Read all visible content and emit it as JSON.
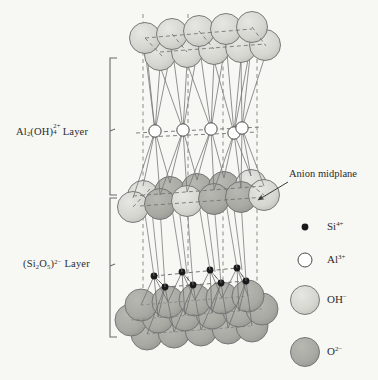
{
  "figure": {
    "name": "kaolinite-crystal-structure",
    "background_color": "#f7f7f4"
  },
  "labels": {
    "al_layer": {
      "formula_base": "Al",
      "sub1": "2",
      "mid": "(OH)",
      "sup_charge": "2+",
      "sub_count": "4",
      "suffix": " Layer"
    },
    "si_layer": {
      "open": "(Si",
      "sub1": "2",
      "o": "O",
      "sub2": "5",
      "close": ")",
      "sup_charge": "2−",
      "suffix": " Layer"
    },
    "anion_midplane": "Anion midplane"
  },
  "legend": {
    "items": [
      {
        "key": "si",
        "symbol": "Si",
        "charge": "4+",
        "marker": "filled-dot",
        "color": "#1a1a1a",
        "radius": 3.4
      },
      {
        "key": "al",
        "symbol": "Al",
        "charge": "3+",
        "marker": "open-circle",
        "color": "#ffffff",
        "radius": 7.0
      },
      {
        "key": "oh",
        "symbol": "OH",
        "charge": "−",
        "marker": "light-sphere",
        "color": "#d6d6d1",
        "radius": 14.5
      },
      {
        "key": "o",
        "symbol": "O",
        "charge": "2−",
        "marker": "dark-sphere",
        "color": "#a9a9a4",
        "radius": 14.5
      }
    ]
  },
  "colors": {
    "oh_fill": "#d6d6d1",
    "o_fill": "#a9a9a4",
    "al_fill": "#ffffff",
    "si_fill": "#1a1a1a",
    "outline": "#6e6e6e",
    "bond": "#767676",
    "dash": "#8a8a8a",
    "bracket": "#6b6b6b",
    "text": "#2b2b2b"
  },
  "structure": {
    "type": "layered-silicate-ball-model",
    "vertical_dash_lines_x": [
      143,
      188,
      223,
      257
    ],
    "oh_top_back_row": [
      {
        "cx": 145,
        "cy": 38
      },
      {
        "cx": 172,
        "cy": 34
      },
      {
        "cx": 199,
        "cy": 31
      },
      {
        "cx": 226,
        "cy": 29
      },
      {
        "cx": 252,
        "cy": 27
      }
    ],
    "oh_top_front_row": [
      {
        "cx": 160,
        "cy": 55
      },
      {
        "cx": 187,
        "cy": 52
      },
      {
        "cx": 214,
        "cy": 49
      },
      {
        "cx": 241,
        "cy": 47
      },
      {
        "cx": 265,
        "cy": 45
      }
    ],
    "al_row": [
      {
        "cx": 155,
        "cy": 131
      },
      {
        "cx": 183,
        "cy": 130
      },
      {
        "cx": 211,
        "cy": 129
      },
      {
        "cx": 234,
        "cy": 133
      },
      {
        "cx": 242,
        "cy": 128
      }
    ],
    "mid_layer_back": [
      {
        "cx": 143,
        "cy": 196,
        "type": "oh"
      },
      {
        "cx": 170,
        "cy": 192,
        "type": "o"
      },
      {
        "cx": 197,
        "cy": 189,
        "type": "o"
      },
      {
        "cx": 224,
        "cy": 187,
        "type": "o"
      },
      {
        "cx": 251,
        "cy": 185,
        "type": "oh"
      }
    ],
    "mid_layer_front": [
      {
        "cx": 133,
        "cy": 207,
        "type": "oh"
      },
      {
        "cx": 160,
        "cy": 204,
        "type": "o"
      },
      {
        "cx": 187,
        "cy": 201,
        "type": "oh"
      },
      {
        "cx": 214,
        "cy": 199,
        "type": "o"
      },
      {
        "cx": 241,
        "cy": 197,
        "type": "o"
      },
      {
        "cx": 264,
        "cy": 195,
        "type": "oh"
      }
    ],
    "si_dots_back": [
      {
        "cx": 154,
        "cy": 276
      },
      {
        "cx": 182,
        "cy": 272
      },
      {
        "cx": 210,
        "cy": 270
      },
      {
        "cx": 237,
        "cy": 268
      }
    ],
    "si_dots_front": [
      {
        "cx": 165,
        "cy": 287
      },
      {
        "cx": 193,
        "cy": 285
      },
      {
        "cx": 221,
        "cy": 283
      },
      {
        "cx": 246,
        "cy": 281
      }
    ],
    "bottom_rows": [
      [
        {
          "cx": 141,
          "cy": 305
        },
        {
          "cx": 168,
          "cy": 302
        },
        {
          "cx": 195,
          "cy": 300
        },
        {
          "cx": 222,
          "cy": 298
        },
        {
          "cx": 248,
          "cy": 296
        }
      ],
      [
        {
          "cx": 131,
          "cy": 320
        },
        {
          "cx": 158,
          "cy": 317
        },
        {
          "cx": 185,
          "cy": 315
        },
        {
          "cx": 212,
          "cy": 313
        },
        {
          "cx": 239,
          "cy": 311
        },
        {
          "cx": 262,
          "cy": 309
        }
      ],
      [
        {
          "cx": 147,
          "cy": 334
        },
        {
          "cx": 174,
          "cy": 332
        },
        {
          "cx": 201,
          "cy": 330
        },
        {
          "cx": 228,
          "cy": 328
        },
        {
          "cx": 252,
          "cy": 326
        }
      ]
    ]
  }
}
